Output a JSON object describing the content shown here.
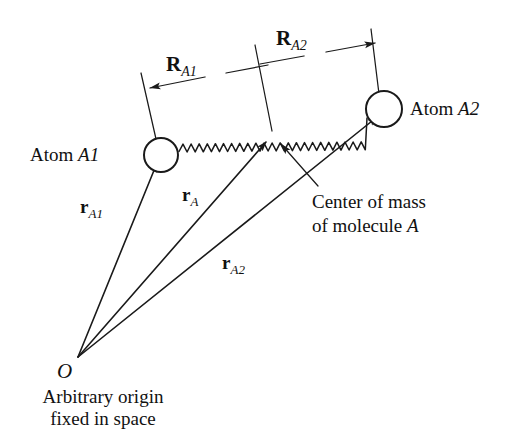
{
  "figure": {
    "background_color": "#ffffff",
    "ink_color": "#1a1a1a"
  },
  "labels": {
    "atom_a1": "Atom ",
    "atom_a1_italic": "A1",
    "atom_a2": "Atom ",
    "atom_a2_italic": "A2",
    "origin_letter": "O",
    "caption_line1": "Arbitrary origin",
    "caption_line2": "fixed in space",
    "callout_line1": "Center of mass",
    "callout_line2_pre": "of molecule ",
    "callout_line2_italic": "A"
  },
  "vectors": [
    {
      "name": "r_A1",
      "symbol": "r",
      "subscript": "A1",
      "from": "origin",
      "to": "atom-a1",
      "label_x": 80,
      "label_y": 196
    },
    {
      "name": "r_A",
      "symbol": "r",
      "subscript": "A",
      "from": "origin",
      "to": "center-of-mass",
      "label_x": 182,
      "label_y": 184
    },
    {
      "name": "r_A2",
      "symbol": "r",
      "subscript": "A2",
      "from": "origin",
      "to": "atom-a2",
      "label_x": 222,
      "label_y": 252
    }
  ],
  "dimensions": [
    {
      "name": "R_A1",
      "symbol": "R",
      "subscript": "A1",
      "description": "distance from atom A1 to center of mass",
      "label_x": 178,
      "label_y": 66
    },
    {
      "name": "R_A2",
      "symbol": "R",
      "subscript": "A2",
      "description": "distance from center of mass to atom A2",
      "label_x": 288,
      "label_y": 40
    }
  ],
  "geometry": {
    "origin": {
      "x": 78,
      "y": 357
    },
    "atom_a1": {
      "x": 161,
      "y": 155,
      "r": 17
    },
    "atom_a2": {
      "x": 384,
      "y": 109,
      "r": 18
    },
    "center_of_mass": {
      "x": 272,
      "y": 135
    },
    "spring_start": {
      "x": 179,
      "y": 151
    },
    "spring_end": {
      "x": 367,
      "y": 118
    }
  }
}
